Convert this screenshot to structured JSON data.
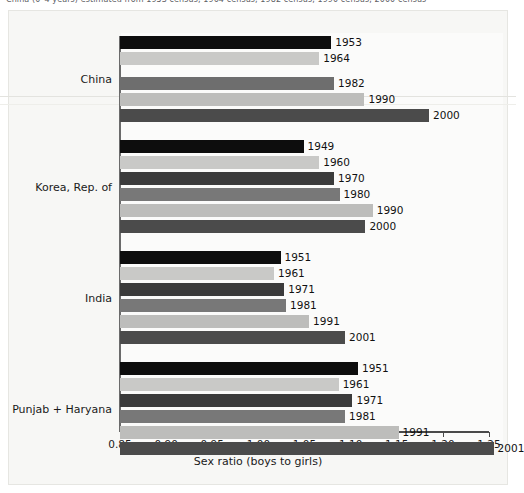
{
  "caption": {
    "partial_text": "China (0–4 years) estimated from 1953 census, 1964 census, 1982 census, 1990 census, 2000 census"
  },
  "chart_data": {
    "type": "bar",
    "orientation": "horizontal",
    "title": "",
    "xlabel": "Sex ratio (boys to girls)",
    "ylabel": "",
    "xlim": [
      0.85,
      1.25
    ],
    "xticks": [
      "0.85",
      "0.90",
      "0.95",
      "1.00",
      "1.05",
      "1.10",
      "1.15",
      "1.20",
      "1.25"
    ],
    "xtick_values": [
      0.85,
      0.9,
      0.95,
      1.0,
      1.05,
      1.1,
      1.15,
      1.2,
      1.25
    ],
    "grid": false,
    "legend": "none",
    "groups": [
      {
        "name": "China",
        "bars": [
          {
            "label": "1953",
            "value": 1.079,
            "color": "#0d0d0d"
          },
          {
            "label": "1964",
            "value": 1.066,
            "color": "#c9c9c7"
          },
          {
            "label": "1982",
            "value": 1.082,
            "color": "#6e6e6e"
          },
          {
            "label": "1990",
            "value": 1.115,
            "color": "#bdbdbb"
          },
          {
            "label": "2000",
            "value": 1.185,
            "color": "#4b4b4b"
          }
        ]
      },
      {
        "name": "Korea, Rep. of",
        "bars": [
          {
            "label": "1949",
            "value": 1.049,
            "color": "#0d0d0d"
          },
          {
            "label": "1960",
            "value": 1.066,
            "color": "#c9c9c7"
          },
          {
            "label": "1970",
            "value": 1.082,
            "color": "#3b3b3b"
          },
          {
            "label": "1980",
            "value": 1.088,
            "color": "#787878"
          },
          {
            "label": "1990",
            "value": 1.124,
            "color": "#bdbdbb"
          },
          {
            "label": "2000",
            "value": 1.116,
            "color": "#4b4b4b"
          }
        ]
      },
      {
        "name": "India",
        "bars": [
          {
            "label": "1951",
            "value": 1.024,
            "color": "#0d0d0d"
          },
          {
            "label": "1961",
            "value": 1.017,
            "color": "#c9c9c7"
          },
          {
            "label": "1971",
            "value": 1.028,
            "color": "#3b3b3b"
          },
          {
            "label": "1981",
            "value": 1.03,
            "color": "#787878"
          },
          {
            "label": "1991",
            "value": 1.055,
            "color": "#bdbdbb"
          },
          {
            "label": "2001",
            "value": 1.094,
            "color": "#4b4b4b"
          }
        ]
      },
      {
        "name": "Punjab + Haryana",
        "bars": [
          {
            "label": "1951",
            "value": 1.108,
            "color": "#0d0d0d"
          },
          {
            "label": "1961",
            "value": 1.087,
            "color": "#c9c9c7"
          },
          {
            "label": "1971",
            "value": 1.102,
            "color": "#3b3b3b"
          },
          {
            "label": "1981",
            "value": 1.094,
            "color": "#787878"
          },
          {
            "label": "1991",
            "value": 1.152,
            "color": "#bdbdbb"
          },
          {
            "label": "2001",
            "value": 1.255,
            "color": "#4b4b4b"
          }
        ]
      }
    ]
  }
}
